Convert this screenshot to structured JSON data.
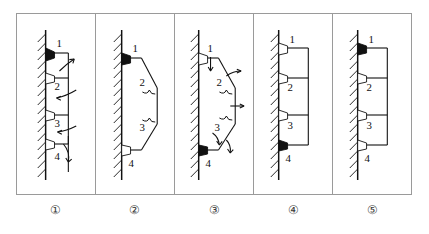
{
  "figure": {
    "type": "mechanics-support-diagram",
    "panel_count": 5,
    "colors": {
      "line": "#111111",
      "border": "#9a9a9a",
      "fixed_support_fill": "#111111",
      "pin_support_fill": "#ffffff",
      "background": "#ffffff"
    },
    "legend_meaning": {
      "filled_marker": "fixed / built-in support (black triangle)",
      "hollow_marker": "pin / hinge support (white triangle)",
      "hatched_line": "rigid wall (ground)",
      "curved_arrow": "applied rotation or load direction"
    }
  },
  "panels": [
    {
      "id": "panel-1",
      "caption": "①",
      "shape": "stacked-rectangles",
      "joints": [
        {
          "label": "1",
          "type": "fixed"
        },
        {
          "label": "2",
          "type": "pin"
        },
        {
          "label": "3",
          "type": "pin"
        },
        {
          "label": "4",
          "type": "pin"
        }
      ],
      "arrows": [
        {
          "name": "arrow-upper-right",
          "direction": "up-right"
        },
        {
          "name": "arrow-middle-left",
          "direction": "left"
        },
        {
          "name": "arrow-lower-left",
          "direction": "left"
        },
        {
          "name": "arrow-bottom-down",
          "direction": "down"
        }
      ]
    },
    {
      "id": "panel-2",
      "caption": "②",
      "shape": "hexagonal-bulge",
      "joints": [
        {
          "label": "1",
          "type": "fixed"
        },
        {
          "label": "2",
          "type": "pin"
        },
        {
          "label": "3",
          "type": "pin"
        },
        {
          "label": "4",
          "type": "pin"
        }
      ],
      "arrows": [
        {
          "name": "hook-mark-upper",
          "direction": "inward"
        },
        {
          "name": "hook-mark-lower",
          "direction": "inward"
        }
      ]
    },
    {
      "id": "panel-3",
      "caption": "③",
      "shape": "hexagonal-bulge",
      "joints": [
        {
          "label": "1",
          "type": "pin"
        },
        {
          "label": "2",
          "type": "pin"
        },
        {
          "label": "3",
          "type": "pin"
        },
        {
          "label": "4",
          "type": "fixed"
        }
      ],
      "arrows": [
        {
          "name": "arrow-top-down",
          "direction": "down"
        },
        {
          "name": "arrow-upper-right",
          "direction": "right"
        },
        {
          "name": "arrow-middle-right",
          "direction": "right"
        },
        {
          "name": "arrow-lower-down",
          "direction": "down"
        }
      ]
    },
    {
      "id": "panel-4",
      "caption": "④",
      "shape": "stacked-rectangles",
      "joints": [
        {
          "label": "1",
          "type": "pin"
        },
        {
          "label": "2",
          "type": "pin"
        },
        {
          "label": "3",
          "type": "pin"
        },
        {
          "label": "4",
          "type": "fixed"
        }
      ],
      "arrows": []
    },
    {
      "id": "panel-5",
      "caption": "⑤",
      "shape": "stacked-rectangles",
      "joints": [
        {
          "label": "1",
          "type": "fixed"
        },
        {
          "label": "2",
          "type": "pin"
        },
        {
          "label": "3",
          "type": "pin"
        },
        {
          "label": "4",
          "type": "pin"
        }
      ],
      "arrows": []
    }
  ]
}
